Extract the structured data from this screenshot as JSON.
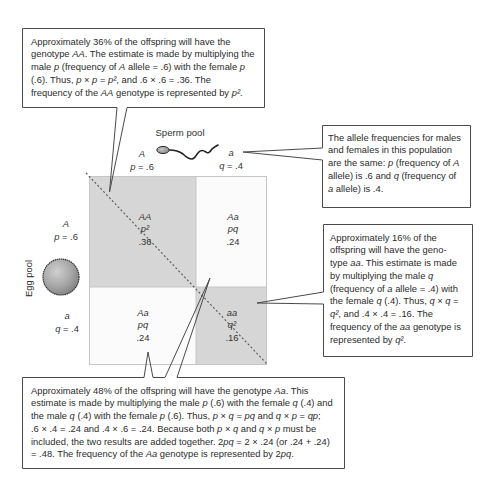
{
  "sperm_pool": {
    "label": "Sperm pool",
    "icon": "sperm-icon",
    "alleles": [
      {
        "allele": "A",
        "var": "p",
        "freq": " = .6"
      },
      {
        "allele": "a",
        "var": "q",
        "freq": " = .4"
      }
    ]
  },
  "egg_pool": {
    "label": "Egg pool",
    "icon": "egg-icon",
    "alleles": [
      {
        "allele": "A",
        "var": "p",
        "freq": " = .6"
      },
      {
        "allele": "a",
        "var": "q",
        "freq": " = .4"
      }
    ]
  },
  "punnett": {
    "cells": [
      {
        "position": "top-left",
        "genotype": "AA",
        "expr": "p²",
        "value": ".36",
        "shaded": true
      },
      {
        "position": "top-right",
        "genotype": "Aa",
        "expr": "pq",
        "value": ".24",
        "shaded": false
      },
      {
        "position": "bottom-left",
        "genotype": "Aa",
        "expr": "pq",
        "value": ".24",
        "shaded": false
      },
      {
        "position": "bottom-right",
        "genotype": "aa",
        "expr": "q²",
        "value": ".16",
        "shaded": true
      }
    ]
  },
  "callouts": {
    "homozygous_dominant": {
      "lines": [
        [
          "Approximately 36% of the offspring will have the"
        ],
        [
          "genotype ",
          {
            "i": "AA"
          },
          ". The estimate is made by multiplying the"
        ],
        [
          "male ",
          {
            "i": "p"
          },
          " (frequency of ",
          {
            "i": "A"
          },
          " allele = .6) with the female ",
          {
            "i": "p"
          }
        ],
        [
          "(.6). Thus, ",
          {
            "i": "p"
          },
          " × ",
          {
            "i": "p"
          },
          " = ",
          {
            "i": "p²"
          },
          ", and .6 × .6 = .36. The"
        ],
        [
          "frequency of the ",
          {
            "i": "AA"
          },
          " genotype is represented by ",
          {
            "i": "p²"
          },
          "."
        ]
      ]
    },
    "allele_frequencies": {
      "lines": [
        [
          "The allele frequencies for males"
        ],
        [
          "and females in this population"
        ],
        [
          "are the same: ",
          {
            "i": "p"
          },
          " (frequency of ",
          {
            "i": "A"
          }
        ],
        [
          "allele) is .6 and ",
          {
            "i": "q"
          },
          " (frequency of"
        ],
        [
          {
            "i": "a"
          },
          " allele) is .4."
        ]
      ]
    },
    "homozygous_recessive": {
      "lines": [
        [
          "Approximately 16% of the"
        ],
        [
          "offspring will have the geno-"
        ],
        [
          "type ",
          {
            "i": "aa"
          },
          ". This estimate is made"
        ],
        [
          "by multiplying the male ",
          {
            "i": "q"
          }
        ],
        [
          "(frequency of ",
          {
            "i": "a"
          },
          " allele = .4) with"
        ],
        [
          "the female ",
          {
            "i": "q"
          },
          " (.4). Thus, ",
          {
            "i": "q"
          },
          " × ",
          {
            "i": "q"
          },
          " ="
        ],
        [
          {
            "i": "q²"
          },
          ", and .4 × .4 = .16. The"
        ],
        [
          "frequency of the ",
          {
            "i": "aa"
          },
          " genotype is"
        ],
        [
          "represented by ",
          {
            "i": "q²"
          },
          "."
        ]
      ]
    },
    "heterozygous": {
      "lines": [
        [
          "Approximately 48% of the offspring will have the genotype ",
          {
            "i": "Aa"
          },
          ". This"
        ],
        [
          "estimate is made by multiplying the male ",
          {
            "i": "p"
          },
          " (.6) with the female ",
          {
            "i": "q"
          },
          " (.4) and"
        ],
        [
          "the male ",
          {
            "i": "q"
          },
          " (.4) with the female ",
          {
            "i": "p"
          },
          " (.6). Thus, ",
          {
            "i": "p"
          },
          " × ",
          {
            "i": "q"
          },
          " = ",
          {
            "i": "pq"
          },
          " and ",
          {
            "i": "q"
          },
          " × ",
          {
            "i": "p"
          },
          " = ",
          {
            "i": "qp"
          },
          ";"
        ],
        [
          ".6 × .4 = .24 and .4 × .6 = .24. Because both ",
          {
            "i": "p"
          },
          " × ",
          {
            "i": "q"
          },
          " and ",
          {
            "i": "q"
          },
          " × ",
          {
            "i": "p"
          },
          " must be"
        ],
        [
          "included, the two results are added together. 2",
          {
            "i": "pq"
          },
          " = 2 × .24 (or .24 + .24)"
        ],
        [
          "= .48. The frequency of the ",
          {
            "i": "Aa"
          },
          " genotype is represented by 2",
          {
            "i": "pq"
          },
          "."
        ]
      ]
    }
  },
  "colors": {
    "shaded_cell": "#d6d6d6",
    "unshaded_cell": "#fbfbfb",
    "callout_border": "#4a4a4a",
    "text": "#2b2b2b",
    "grid_line": "#c6c6c6"
  }
}
